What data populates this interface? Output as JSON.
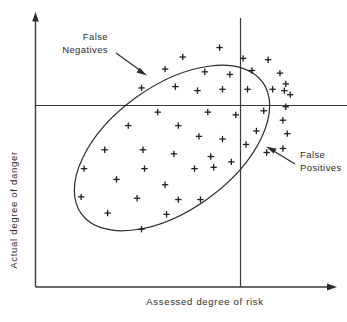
{
  "figure": {
    "title": "",
    "background_color": "#ffffff",
    "line_color": "#2b2b2b",
    "marker_color": "#1f1f1f"
  },
  "axes": {
    "x_label": "Assessed degree of risk",
    "y_label": "Actual degree of danger",
    "x_axis_name": "x-axis",
    "y_axis_name": "y-axis",
    "arrowheads": true,
    "ticks": false,
    "gridlines": false
  },
  "thresholds": {
    "horizontal_label": "danger-threshold",
    "vertical_label": "risk-threshold"
  },
  "annotations": [
    {
      "id": "false-negatives",
      "line1": "False",
      "line2": "Negatives",
      "arrow_from": [
        122,
        61
      ],
      "arrow_to": [
        146,
        75
      ]
    },
    {
      "id": "false-positives",
      "line1": "False",
      "line2": "Positives",
      "arrow_from": [
        312,
        177
      ],
      "arrow_to": [
        278,
        155
      ]
    }
  ],
  "chart_data": {
    "type": "scatter",
    "title": "",
    "xlabel": "Assessed degree of risk",
    "ylabel": "Actual degree of danger",
    "xlim": [
      0,
      100
    ],
    "ylim": [
      0,
      100
    ],
    "grid": false,
    "legend": null,
    "marker": "plus",
    "annotations": [
      "False Negatives",
      "False Positives"
    ],
    "threshold_x": 68.3,
    "threshold_y": 72.2,
    "ellipse": {
      "center_x": 57.5,
      "center_y": 50.5,
      "semi_major": 44.0,
      "semi_minor": 24.5,
      "rotation_deg": -36
    },
    "points": [
      [
        62.5,
        89.0
      ],
      [
        50.0,
        85.5
      ],
      [
        70.5,
        85.0
      ],
      [
        79.0,
        84.5
      ],
      [
        44.0,
        81.0
      ],
      [
        57.5,
        80.0
      ],
      [
        66.0,
        79.0
      ],
      [
        73.5,
        80.5
      ],
      [
        83.0,
        79.5
      ],
      [
        85.0,
        75.5
      ],
      [
        36.0,
        74.0
      ],
      [
        47.5,
        74.5
      ],
      [
        55.0,
        73.0
      ],
      [
        63.5,
        73.5
      ],
      [
        72.0,
        73.5
      ],
      [
        80.5,
        73.5
      ],
      [
        84.5,
        73.0
      ],
      [
        86.5,
        71.5
      ],
      [
        85.0,
        67.0
      ],
      [
        84.0,
        62.0
      ],
      [
        85.5,
        57.0
      ],
      [
        84.0,
        51.5
      ],
      [
        41.5,
        65.0
      ],
      [
        58.5,
        65.0
      ],
      [
        68.0,
        64.0
      ],
      [
        77.5,
        65.5
      ],
      [
        31.5,
        60.0
      ],
      [
        48.5,
        60.0
      ],
      [
        75.0,
        58.0
      ],
      [
        55.5,
        56.0
      ],
      [
        63.5,
        55.0
      ],
      [
        71.5,
        53.0
      ],
      [
        23.5,
        51.0
      ],
      [
        36.5,
        51.0
      ],
      [
        47.0,
        49.5
      ],
      [
        59.5,
        48.5
      ],
      [
        78.5,
        50.0
      ],
      [
        66.5,
        46.5
      ],
      [
        16.5,
        44.0
      ],
      [
        37.0,
        44.0
      ],
      [
        54.0,
        44.0
      ],
      [
        60.5,
        44.5
      ],
      [
        27.5,
        40.0
      ],
      [
        44.0,
        38.0
      ],
      [
        15.5,
        33.5
      ],
      [
        34.5,
        33.0
      ],
      [
        48.5,
        32.5
      ],
      [
        56.0,
        32.5
      ],
      [
        24.5,
        27.5
      ],
      [
        44.5,
        27.0
      ],
      [
        36.0,
        21.5
      ]
    ]
  }
}
